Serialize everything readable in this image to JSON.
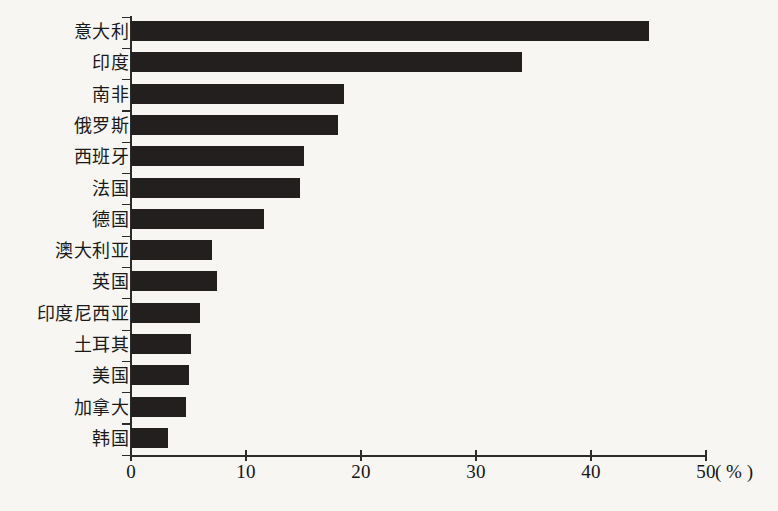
{
  "chart_data": {
    "type": "bar",
    "orientation": "horizontal",
    "title": "",
    "xlabel": "(%)",
    "ylabel": "",
    "xlim": [
      0,
      50
    ],
    "xticks": [
      0,
      10,
      20,
      30,
      40,
      50
    ],
    "xtick_labels": [
      "0",
      "10",
      "20",
      "30",
      "40",
      "50"
    ],
    "unit_label": "( % )",
    "grid": false,
    "legend": false,
    "bar_color": "#231f1e",
    "background_color": "#f7f6f2",
    "axis_color": "#2b2b2b",
    "categories": [
      "意大利",
      "印度",
      "南非",
      "俄罗斯",
      "西班牙",
      "法国",
      "德国",
      "澳大利亚",
      "英国",
      "印度尼西亚",
      "土耳其",
      "美国",
      "加拿大",
      "韩国"
    ],
    "values": [
      45,
      34,
      18.5,
      18,
      15,
      14.7,
      11.6,
      7,
      7.5,
      6,
      5.2,
      5,
      4.8,
      3.2
    ]
  }
}
